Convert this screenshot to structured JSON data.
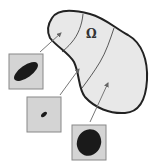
{
  "diagram": {
    "region_label": "Ω",
    "region": {
      "fill": "#e8e8e8",
      "stroke": "#222222",
      "description": "irregular domain subdivided into three subregions by two curves"
    },
    "insets": [
      {
        "name": "top-left",
        "ellipse": "large elongated tilted ellipse",
        "fill": "#1a1a1a",
        "box_fill": "#d0d0d0"
      },
      {
        "name": "middle",
        "ellipse": "small tilted ellipse",
        "fill": "#1a1a1a",
        "box_fill": "#d0d0d0"
      },
      {
        "name": "bottom",
        "ellipse": "large nearly circular ellipse",
        "fill": "#1a1a1a",
        "box_fill": "#d0d0d0"
      }
    ],
    "arrows": 3
  }
}
